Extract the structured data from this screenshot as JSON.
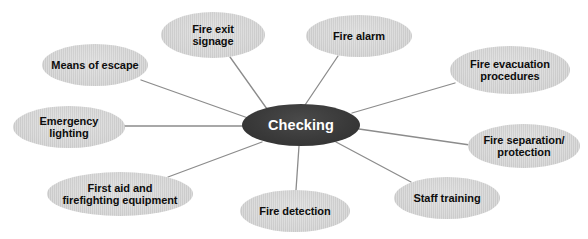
{
  "diagram": {
    "type": "mind-map",
    "title": "Checking",
    "background_color": "#ffffff",
    "center": {
      "label": "Checking",
      "fill_color": "#3a3a3a",
      "text_color": "#ffffff",
      "cx": 301,
      "cy": 125,
      "rx": 59,
      "ry": 21
    },
    "edge_color": "#8c8c8c",
    "leaf_fill_color": "#cdcdcd",
    "leaf_text_color": "#0d0d0d",
    "nodes": [
      {
        "id": "means-of-escape",
        "label": "Means of escape",
        "cx": 95,
        "cy": 65,
        "rx": 53,
        "ry": 21
      },
      {
        "id": "fire-exit-signage",
        "label": "Fire exit\nsignage",
        "cx": 213,
        "cy": 35,
        "rx": 52,
        "ry": 23
      },
      {
        "id": "fire-alarm",
        "label": "Fire alarm",
        "cx": 359,
        "cy": 36,
        "rx": 53,
        "ry": 21
      },
      {
        "id": "fire-evacuation-procedures",
        "label": "Fire evacuation\nprocedures",
        "cx": 510,
        "cy": 70,
        "rx": 60,
        "ry": 24
      },
      {
        "id": "fire-separation-protection",
        "label": "Fire separation/\nprotection",
        "cx": 524,
        "cy": 146,
        "rx": 56,
        "ry": 22
      },
      {
        "id": "staff-training",
        "label": "Staff training",
        "cx": 447,
        "cy": 198,
        "rx": 53,
        "ry": 21
      },
      {
        "id": "fire-detection",
        "label": "Fire detection",
        "cx": 295,
        "cy": 211,
        "rx": 55,
        "ry": 21
      },
      {
        "id": "first-aid-and-firefighting-equipment",
        "label": "First aid and\nfirefighting equipment",
        "cx": 120,
        "cy": 194,
        "rx": 73,
        "ry": 22
      },
      {
        "id": "emergency-lighting",
        "label": "Emergency\nlighting",
        "cx": 69,
        "cy": 127,
        "rx": 56,
        "ry": 21
      }
    ],
    "edges": [
      {
        "from": "center",
        "to": "means-of-escape",
        "x1": 248,
        "y1": 118,
        "x2": 141,
        "y2": 80
      },
      {
        "from": "center",
        "to": "fire-exit-signage",
        "x1": 267,
        "y1": 109,
        "x2": 230,
        "y2": 57
      },
      {
        "from": "center",
        "to": "fire-alarm",
        "x1": 305,
        "y1": 105,
        "x2": 338,
        "y2": 56
      },
      {
        "from": "center",
        "to": "fire-evacuation-procedures",
        "x1": 352,
        "y1": 113,
        "x2": 455,
        "y2": 83
      },
      {
        "from": "center",
        "to": "fire-separation-protection",
        "x1": 359,
        "y1": 129,
        "x2": 470,
        "y2": 145
      },
      {
        "from": "center",
        "to": "staff-training",
        "x1": 336,
        "y1": 142,
        "x2": 411,
        "y2": 182
      },
      {
        "from": "center",
        "to": "fire-detection",
        "x1": 299,
        "y1": 146,
        "x2": 296,
        "y2": 190
      },
      {
        "from": "center",
        "to": "first-aid-and-firefighting-equipment",
        "x1": 262,
        "y1": 142,
        "x2": 168,
        "y2": 177
      },
      {
        "from": "center",
        "to": "emergency-lighting",
        "x1": 244,
        "y1": 126,
        "x2": 123,
        "y2": 126
      }
    ]
  }
}
